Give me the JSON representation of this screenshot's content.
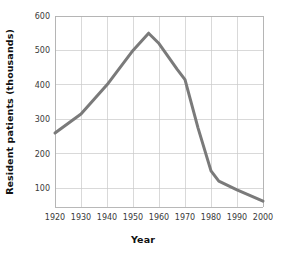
{
  "chart_data": {
    "type": "line",
    "title": "",
    "xlabel": "Year",
    "ylabel": "Resident patients (thousands)",
    "xlim": [
      1920,
      2000
    ],
    "ylim": [
      45,
      600
    ],
    "xticks": [
      1920,
      1930,
      1940,
      1950,
      1960,
      1970,
      1980,
      1990,
      2000
    ],
    "xtick_labels": [
      "1920",
      "1930",
      "1940",
      "1950",
      "1960",
      "1970",
      "1980",
      "1990",
      "2000"
    ],
    "yticks": [
      100,
      200,
      300,
      400,
      500,
      600
    ],
    "ytick_labels": [
      "100",
      "200",
      "300",
      "400",
      "500",
      "600"
    ],
    "grid": true,
    "legend": "none",
    "series": [
      {
        "name": "Resident patients",
        "color": "#7a7a7a",
        "x": [
          1920,
          1930,
          1940,
          1950,
          1956,
          1960,
          1967,
          1970,
          1975,
          1980,
          1983,
          1990,
          2000
        ],
        "y": [
          260,
          315,
          400,
          500,
          550,
          520,
          445,
          415,
          275,
          150,
          120,
          95,
          62
        ]
      }
    ]
  },
  "axis_labels": {
    "x_title": "Year",
    "y_title": "Resident patients (thousands)"
  },
  "colors": {
    "line": "#7a7a7a",
    "grid": "#c9c9c9",
    "frame": "#b0b0b0",
    "text": "#1a1a1a",
    "background": "#ffffff"
  }
}
